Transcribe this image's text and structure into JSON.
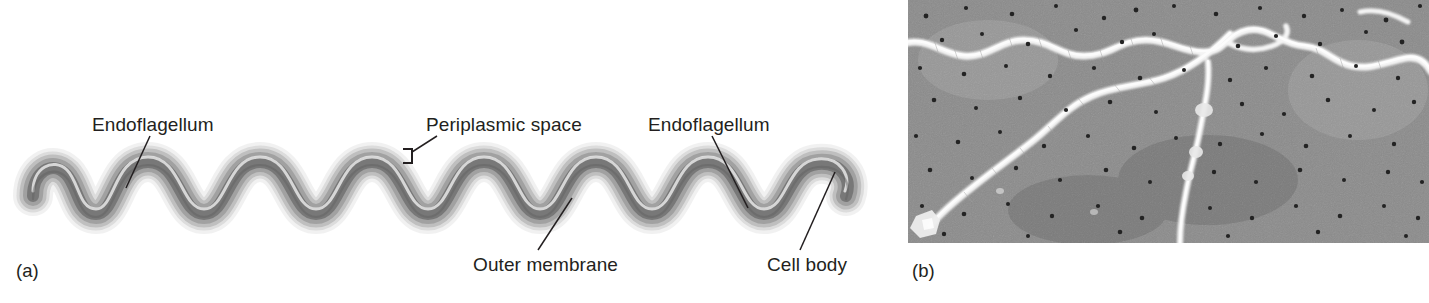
{
  "figure": {
    "panels": [
      {
        "tag": "(a)",
        "tag_x": 16,
        "tag_y": 262,
        "kind": "schematic-drawing",
        "subject": "spirochete",
        "labels": [
          {
            "name": "endoflagellum-left",
            "text": "Endoflagellum",
            "x": 92,
            "y": 115,
            "leader": {
              "x1": 150,
              "y1": 136,
              "x2": 126,
              "y2": 188
            }
          },
          {
            "name": "periplasmic-space",
            "text": "Periplasmic space",
            "x": 426,
            "y": 115,
            "leader": {
              "x1": 437,
              "y1": 136,
              "x2": 412,
              "y2": 152
            },
            "bracket": {
              "x": 403,
              "y": 149,
              "w": 9,
              "h": 14
            }
          },
          {
            "name": "endoflagellum-right",
            "text": "Endoflagellum",
            "x": 648,
            "y": 115,
            "leader": {
              "x1": 712,
              "y1": 136,
              "x2": 748,
              "y2": 208
            }
          },
          {
            "name": "outer-membrane",
            "text": "Outer membrane",
            "x": 473,
            "y": 255,
            "leader": {
              "x1": 538,
              "y1": 250,
              "x2": 572,
              "y2": 198
            }
          },
          {
            "name": "cell-body",
            "text": "Cell body",
            "x": 767,
            "y": 255,
            "leader": {
              "x1": 800,
              "y1": 250,
              "x2": 835,
              "y2": 172
            }
          }
        ]
      },
      {
        "tag": "(b)",
        "tag_x": 912,
        "tag_y": 262,
        "kind": "electron-micrograph",
        "subject": "spirochete cells on filter membrane"
      }
    ]
  },
  "colors": {
    "page_background": "#ffffff",
    "label_text": "#231f20",
    "leader_line": "#231f20",
    "cell_core_dark": "#6d6d6d",
    "cell_mid_gray": "#9a9a9a",
    "cell_outer_light": "#dcdcdc",
    "micrograph_background": "#8b8b8b",
    "micrograph_filament": "#f2f2f2",
    "micrograph_pore": "#2a2a2a"
  }
}
